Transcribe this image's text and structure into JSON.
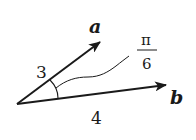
{
  "diagram": {
    "type": "vector-angle",
    "colors": {
      "background": "#ffffff",
      "stroke": "#1a1a1a"
    },
    "vectors": [
      {
        "id": "a",
        "label": "a",
        "magnitude_label": "3"
      },
      {
        "id": "b",
        "label": "b",
        "magnitude_label": "4"
      }
    ],
    "angle": {
      "numerator": "π",
      "denominator": "6"
    }
  }
}
